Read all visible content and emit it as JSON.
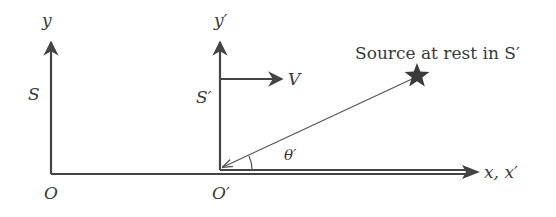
{
  "diagram": {
    "frame_s": {
      "name_label": "S",
      "y_axis_label": "y",
      "origin_label": "O"
    },
    "frame_s_prime": {
      "name_label": "S′",
      "y_axis_label": "y′",
      "origin_label": "O′",
      "velocity_label": "V"
    },
    "shared_x_axis_label": "x, x′",
    "source": {
      "label": "Source at rest in S′",
      "icon": "star-icon"
    },
    "angle_label": "θ′",
    "colors": {
      "stroke": "#444444",
      "text": "#3a3a3a",
      "background": "#ffffff"
    }
  }
}
